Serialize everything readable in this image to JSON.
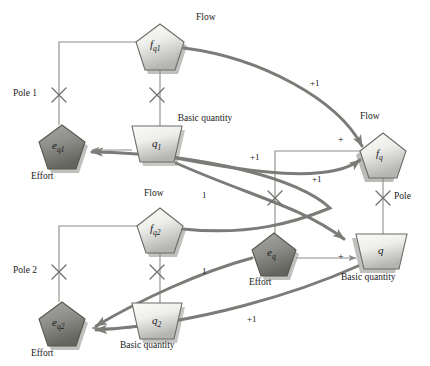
{
  "figure": {
    "type": "signal-flow-bond-graph",
    "title": ""
  },
  "nodes": [
    {
      "id": "f_q1",
      "var": "f",
      "sub": "q1",
      "shape": "pentagon",
      "role": "flow",
      "caption": "Flow",
      "x": 157,
      "y": 42,
      "w": 48,
      "h": 44,
      "fill": "light"
    },
    {
      "id": "e_q1",
      "var": "e",
      "sub": "q1",
      "shape": "pentagon",
      "role": "effort",
      "caption": "Effort",
      "x": 59,
      "y": 143,
      "w": 46,
      "h": 42,
      "fill": "dark"
    },
    {
      "id": "q_1",
      "var": "q",
      "sub": "1",
      "shape": "trapezoid",
      "role": "basic-quantity",
      "caption": "Basic quantity",
      "x": 157,
      "y": 143,
      "w": 48,
      "h": 38,
      "fill": "light"
    },
    {
      "id": "f_q2",
      "var": "f",
      "sub": "q2",
      "shape": "pentagon",
      "role": "flow",
      "caption": "Flow",
      "x": 157,
      "y": 227,
      "w": 46,
      "h": 42,
      "fill": "light"
    },
    {
      "id": "e_q2",
      "var": "e",
      "sub": "q2",
      "shape": "pentagon",
      "role": "effort",
      "caption": "Effort",
      "x": 59,
      "y": 320,
      "w": 46,
      "h": 42,
      "fill": "dark"
    },
    {
      "id": "q_2",
      "var": "q",
      "sub": "2",
      "shape": "trapezoid",
      "role": "basic-quantity",
      "caption": "Basic quantity",
      "x": 157,
      "y": 320,
      "w": 48,
      "h": 38,
      "fill": "light"
    },
    {
      "id": "f_q",
      "var": "f",
      "sub": "q",
      "shape": "pentagon",
      "role": "flow",
      "caption": "Flow",
      "x": 381,
      "y": 152,
      "w": 46,
      "h": 42,
      "fill": "light"
    },
    {
      "id": "e_q",
      "var": "e",
      "sub": "q",
      "shape": "pentagon",
      "role": "effort",
      "caption": "Effort",
      "x": 272,
      "y": 250,
      "w": 44,
      "h": 40,
      "fill": "dark"
    },
    {
      "id": "q",
      "var": "q",
      "sub": "",
      "shape": "trapezoid",
      "role": "basic-quantity",
      "caption": "Basic quantity",
      "x": 381,
      "y": 250,
      "w": 46,
      "h": 36,
      "fill": "light"
    }
  ],
  "poles": [
    {
      "id": "pole-1",
      "label": "Pole 1",
      "x": 59,
      "y": 95,
      "label_side": "left"
    },
    {
      "id": "pole-q1",
      "label": "",
      "x": 157,
      "y": 95,
      "label_side": "none"
    },
    {
      "id": "pole-2",
      "label": "Pole 2",
      "x": 59,
      "y": 272,
      "label_side": "left"
    },
    {
      "id": "pole-q2",
      "label": "",
      "x": 157,
      "y": 272,
      "label_side": "none"
    },
    {
      "id": "pole-mid",
      "label": "",
      "x": 275,
      "y": 198,
      "label_side": "none"
    },
    {
      "id": "pole-q",
      "label": "Pole",
      "x": 381,
      "y": 198,
      "label_side": "right"
    }
  ],
  "gain_labels": [
    {
      "id": "gain-fq1-fq",
      "text": "+1",
      "x": 316,
      "y": 84
    },
    {
      "id": "gain-q1-eq1",
      "text": "+1",
      "x": 256,
      "y": 158
    },
    {
      "id": "gain-eq-fq",
      "text": "+1",
      "x": 318,
      "y": 180
    },
    {
      "id": "gain-fq2-eq1",
      "text": "1",
      "x": 205,
      "y": 196
    },
    {
      "id": "gain-q2-eq2",
      "text": "1",
      "x": 205,
      "y": 272
    },
    {
      "id": "gain-q-eq2",
      "text": "+1",
      "x": 253,
      "y": 320
    }
  ],
  "sign_labels": [
    {
      "id": "sign-fq-in",
      "text": "+",
      "x": 341,
      "y": 141
    },
    {
      "id": "sign-q-in",
      "text": "+",
      "x": 341,
      "y": 258
    }
  ],
  "colors": {
    "node_light_top": "#f2f2f0",
    "node_light_bottom": "#b9b9b5",
    "node_dark_top": "#9a9a96",
    "node_dark_bottom": "#6f6f6b",
    "node_stroke": "#6b6b67",
    "shadow": "#8a8a86",
    "thin_line": "#8d8d89",
    "thick_line": "#7b7b77",
    "text": "#1a1a1a"
  }
}
